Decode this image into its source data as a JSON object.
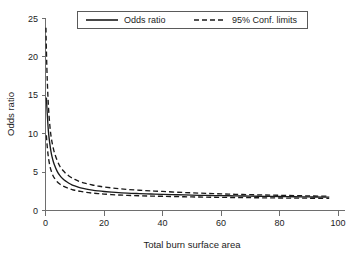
{
  "chart_data": {
    "type": "line",
    "title": "",
    "xlabel": "Total burn surface area",
    "ylabel": "Odds ratio",
    "xlim": [
      0,
      100
    ],
    "ylim": [
      0,
      25
    ],
    "xticks": [
      0,
      20,
      40,
      60,
      80,
      100
    ],
    "yticks": [
      0,
      5,
      10,
      15,
      20,
      25
    ],
    "xtick_labels": [
      "0",
      "20",
      "40",
      "60",
      "80",
      "100"
    ],
    "ytick_labels": [
      "0",
      "5",
      "10",
      "15",
      "20",
      "25"
    ],
    "grid": false,
    "legend_position": "top-center",
    "series": [
      {
        "name": "Odds ratio",
        "style": "solid",
        "color": "#1a1a1a",
        "x": [
          0.3,
          0.6,
          1,
          1.5,
          2,
          2.5,
          3,
          4,
          5,
          6,
          7,
          8,
          9,
          10,
          12,
          14,
          16,
          18,
          20,
          24,
          28,
          32,
          36,
          40,
          45,
          50,
          55,
          60,
          65,
          70,
          75,
          80,
          85,
          90,
          95,
          97
        ],
        "values": [
          14.7,
          12.6,
          10.3,
          8.6,
          7.4,
          6.6,
          6.0,
          5.1,
          4.5,
          4.1,
          3.8,
          3.55,
          3.35,
          3.2,
          2.95,
          2.78,
          2.65,
          2.55,
          2.47,
          2.35,
          2.26,
          2.2,
          2.15,
          2.1,
          2.05,
          2.0,
          1.96,
          1.93,
          1.9,
          1.87,
          1.84,
          1.82,
          1.79,
          1.77,
          1.75,
          1.74
        ]
      },
      {
        "name": "95% Conf. limits upper",
        "style": "dashed",
        "color": "#1a1a1a",
        "x": [
          0.15,
          0.3,
          0.6,
          1,
          1.5,
          2,
          2.5,
          3,
          4,
          5,
          6,
          7,
          8,
          9,
          10,
          12,
          14,
          16,
          18,
          20,
          24,
          28,
          32,
          36,
          40,
          45,
          50,
          55,
          60,
          65,
          70,
          75,
          80,
          85,
          90,
          95,
          97
        ],
        "values": [
          23.8,
          21.0,
          17.0,
          13.6,
          11.0,
          9.4,
          8.4,
          7.6,
          6.5,
          5.7,
          5.2,
          4.8,
          4.5,
          4.25,
          4.05,
          3.72,
          3.5,
          3.32,
          3.18,
          3.06,
          2.88,
          2.74,
          2.64,
          2.55,
          2.48,
          2.38,
          2.3,
          2.23,
          2.17,
          2.11,
          2.06,
          2.02,
          1.98,
          1.94,
          1.9,
          1.87,
          1.86
        ]
      },
      {
        "name": "95% Conf. limits lower",
        "style": "dashed",
        "color": "#1a1a1a",
        "x": [
          0.3,
          0.6,
          1,
          1.5,
          2,
          2.5,
          3,
          4,
          5,
          6,
          7,
          8,
          9,
          10,
          12,
          14,
          16,
          18,
          20,
          24,
          28,
          32,
          36,
          40,
          45,
          50,
          55,
          60,
          65,
          70,
          75,
          80,
          85,
          90,
          95,
          97
        ],
        "values": [
          9.8,
          8.3,
          6.9,
          5.8,
          5.1,
          4.6,
          4.25,
          3.75,
          3.42,
          3.18,
          3.0,
          2.86,
          2.74,
          2.64,
          2.48,
          2.36,
          2.27,
          2.2,
          2.14,
          2.04,
          1.97,
          1.92,
          1.88,
          1.85,
          1.81,
          1.77,
          1.74,
          1.71,
          1.69,
          1.67,
          1.65,
          1.63,
          1.61,
          1.6,
          1.58,
          1.57
        ]
      }
    ],
    "legend": [
      {
        "label": "Odds ratio",
        "style": "solid"
      },
      {
        "label": "95% Conf. limits",
        "style": "dashed"
      }
    ]
  },
  "colors": {
    "line": "#1a1a1a",
    "axis": "#6e6e6e",
    "text": "#1c1c1c",
    "background": "#ffffff"
  }
}
